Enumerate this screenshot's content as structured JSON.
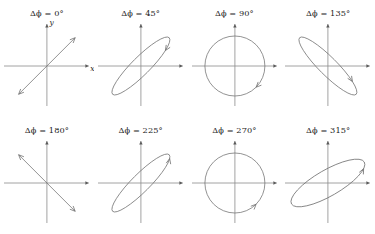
{
  "figure": {
    "title": "",
    "background": "#ffffff",
    "stroke_color": "#6f6f6f",
    "axis_color": "#8a8a8a",
    "text_color": "#1a1a1a",
    "rows": 2,
    "columns": 4
  },
  "axes": {
    "x_label": "x",
    "y_label": "y",
    "labels_shown_on_panel": 1
  },
  "chart_data": {
    "type": "line",
    "xlabel": "x",
    "ylabel": "y",
    "panels": [
      {
        "index": 1,
        "label": "Δϕ = 0°",
        "delta_phi_deg": 0,
        "shape": "line",
        "tilt_deg": 45,
        "semi_major": 40,
        "semi_minor": 0,
        "handedness": "linear",
        "arrow": "double",
        "show_axis_labels": true
      },
      {
        "index": 2,
        "label": "Δϕ = 45°",
        "delta_phi_deg": 45,
        "shape": "ellipse",
        "tilt_deg": 45,
        "semi_major": 40,
        "semi_minor": 9,
        "handedness": "counterclockwise",
        "arrow": "single",
        "arrow_angle_deg": 45,
        "show_axis_labels": false
      },
      {
        "index": 3,
        "label": "Δϕ = 90°",
        "delta_phi_deg": 90,
        "shape": "circle",
        "tilt_deg": 0,
        "semi_major": 30,
        "semi_minor": 30,
        "handedness": "counterclockwise",
        "arrow": "single",
        "arrow_angle_deg": 45,
        "show_axis_labels": false
      },
      {
        "index": 4,
        "label": "Δϕ = 135°",
        "delta_phi_deg": 135,
        "shape": "ellipse",
        "tilt_deg": 135,
        "semi_major": 40,
        "semi_minor": 9,
        "handedness": "counterclockwise",
        "arrow": "single",
        "arrow_angle_deg": 135,
        "show_axis_labels": false
      },
      {
        "index": 5,
        "label": "Δϕ = 180°",
        "delta_phi_deg": 180,
        "shape": "line",
        "tilt_deg": 135,
        "semi_major": 40,
        "semi_minor": 0,
        "handedness": "linear",
        "arrow": "double",
        "show_axis_labels": false
      },
      {
        "index": 6,
        "label": "Δϕ = 225°",
        "delta_phi_deg": 225,
        "shape": "ellipse",
        "tilt_deg": 45,
        "semi_major": 40,
        "semi_minor": 9,
        "handedness": "clockwise",
        "arrow": "single",
        "arrow_angle_deg": 20,
        "show_axis_labels": false
      },
      {
        "index": 7,
        "label": "Δϕ = 270°",
        "delta_phi_deg": 270,
        "shape": "circle",
        "tilt_deg": 0,
        "semi_major": 30,
        "semi_minor": 30,
        "handedness": "clockwise",
        "arrow": "single",
        "arrow_angle_deg": 45,
        "show_axis_labels": false
      },
      {
        "index": 8,
        "label": "Δϕ = 315°",
        "delta_phi_deg": 315,
        "shape": "ellipse",
        "tilt_deg": 30,
        "semi_major": 42,
        "semi_minor": 13,
        "handedness": "clockwise",
        "arrow": "single",
        "arrow_angle_deg": 25,
        "show_axis_labels": false
      }
    ]
  }
}
